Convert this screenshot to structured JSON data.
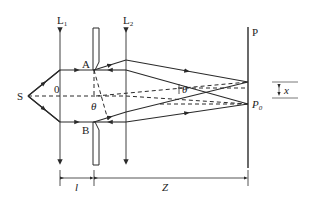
{
  "diagram": {
    "labels": {
      "source": "S",
      "lens1": "L",
      "lens1_sub": "1",
      "lens2": "L",
      "lens2_sub": "2",
      "screen": "P",
      "edge_a": "A",
      "edge_b": "B",
      "origin": "0",
      "angle_left": "θ",
      "angle_right": "θ",
      "point_p0": "P",
      "point_p0_sub": "0",
      "offset": "x",
      "dist_l": "l",
      "dist_z": "Z"
    },
    "colors": {
      "line": "#2a2a2a",
      "background": "#ffffff"
    }
  }
}
